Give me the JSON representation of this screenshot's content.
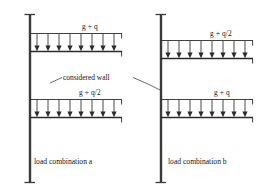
{
  "figure": {
    "annotation": {
      "considered_wall_label": "considered wall"
    },
    "panels": [
      {
        "id": "panel-a",
        "caption": "load combination a",
        "wall_label": "considered wall",
        "slabs": [
          {
            "position": "upper",
            "load_label": "g + q",
            "arrow_count": 8,
            "direction": "down"
          },
          {
            "position": "lower",
            "load_label": "g + q/2",
            "arrow_count": 8,
            "direction": "down"
          }
        ]
      },
      {
        "id": "panel-b",
        "caption": "load combination b",
        "wall_label": "considered wall",
        "slabs": [
          {
            "position": "upper",
            "load_label": "g + q/2",
            "arrow_count": 8,
            "direction": "down"
          },
          {
            "position": "lower",
            "load_label": "g + q",
            "arrow_count": 8,
            "direction": "down"
          }
        ]
      }
    ],
    "colors": {
      "line": "#2b2b2b",
      "wall": "#3a3a3a",
      "arrow": "#4a4a4a",
      "background": "#ffffff",
      "text": "#141414"
    }
  }
}
